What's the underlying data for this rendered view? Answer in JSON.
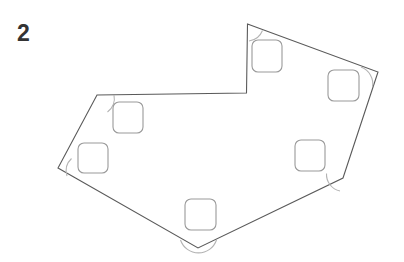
{
  "figure": {
    "label": "2",
    "label_color": "#333333",
    "background_color": "#ffffff",
    "edge_color": "#5a5a5a",
    "arc_color": "#b3b3b3",
    "square_color": "#9a9a9a"
  },
  "polygon": {
    "name": "irregular-heptagon-with-notch",
    "vertex_count": 7,
    "path": "M 247.5 24 L 378 72 L 343 178 L 198 248 L 58 168 L 97 95 L 246.5 93 Z",
    "vertices": [
      {
        "name": "top-peak",
        "x": 247.5,
        "y": 24
      },
      {
        "name": "right",
        "x": 378,
        "y": 72
      },
      {
        "name": "lower-right",
        "x": 343,
        "y": 178
      },
      {
        "name": "bottom",
        "x": 198,
        "y": 248
      },
      {
        "name": "left",
        "x": 58,
        "y": 168
      },
      {
        "name": "upper-left",
        "x": 97,
        "y": 95
      },
      {
        "name": "notch-reflex",
        "x": 246.5,
        "y": 93
      }
    ]
  },
  "angle_arcs": [
    {
      "name": "arc-top-peak",
      "path": "M 249 41 A 17 17 0 0 0 262.5 30.5"
    },
    {
      "name": "arc-right",
      "path": "M 361 67 A 18 18 0 0 1 372.5 87"
    },
    {
      "name": "arc-lower-right",
      "path": "M 326.5 173.5 A 17 17 0 0 0 340 191"
    },
    {
      "name": "arc-bottom",
      "path": "M 180.5 240 A 19 19 0 0 0 216.5 240"
    },
    {
      "name": "arc-left",
      "path": "M 71.5 158.5 A 17 17 0 0 0 67 176"
    },
    {
      "name": "arc-upper-left",
      "path": "M 107.5 112 A 17 17 0 0 0 114 95"
    }
  ],
  "inner_squares": [
    {
      "name": "square-top",
      "x": 252,
      "y": 40,
      "w": 30,
      "h": 32,
      "r": 6
    },
    {
      "name": "square-upper-right",
      "x": 328,
      "y": 70,
      "w": 31,
      "h": 31,
      "r": 6
    },
    {
      "name": "square-upper-left",
      "x": 113,
      "y": 102,
      "w": 30,
      "h": 31,
      "r": 6
    },
    {
      "name": "square-left",
      "x": 78,
      "y": 143,
      "w": 30,
      "h": 30,
      "r": 6
    },
    {
      "name": "square-right",
      "x": 295,
      "y": 140,
      "w": 30,
      "h": 31,
      "r": 6
    },
    {
      "name": "square-bottom",
      "x": 185,
      "y": 199,
      "w": 31,
      "h": 31,
      "r": 6
    }
  ]
}
